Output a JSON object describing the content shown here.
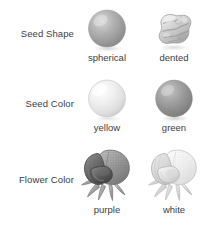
{
  "figure": {
    "title_present": false,
    "background": "#ffffff",
    "text_color": "#3d3d3d",
    "style": "grayscale pea plant trait illustration"
  },
  "rows": [
    {
      "label": "Seed Shape",
      "cells": [
        {
          "caption": "spherical",
          "art": "seed-spherical",
          "tone": "#a8a8a8"
        },
        {
          "caption": "dented",
          "art": "seed-dented",
          "tone": "#cfcfcf"
        }
      ]
    },
    {
      "label": "Seed Color",
      "cells": [
        {
          "caption": "yellow",
          "art": "seed-sphere-light",
          "tone": "#ededed"
        },
        {
          "caption": "green",
          "art": "seed-sphere-dark",
          "tone": "#9a9a9a"
        }
      ]
    },
    {
      "label": "Flower Color",
      "cells": [
        {
          "caption": "purple",
          "art": "flower-dark",
          "tone": "#7d7d7d"
        },
        {
          "caption": "white",
          "art": "flower-light",
          "tone": "#e2e2e2"
        }
      ]
    }
  ]
}
